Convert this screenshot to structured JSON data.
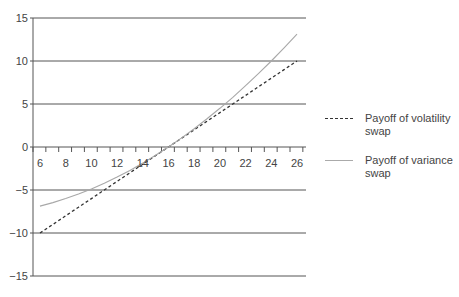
{
  "chart_data": {
    "type": "line",
    "title": "",
    "xlabel": "",
    "ylabel": "",
    "x": [
      6,
      7,
      8,
      9,
      10,
      11,
      12,
      13,
      14,
      15,
      16,
      17,
      18,
      19,
      20,
      21,
      22,
      23,
      24,
      25,
      26
    ],
    "x_tick_labels": [
      "6",
      "8",
      "10",
      "12",
      "14",
      "16",
      "18",
      "20",
      "22",
      "24",
      "26"
    ],
    "y_tick_labels": [
      "15",
      "10",
      "5",
      "0",
      "-5",
      "-10",
      "-15"
    ],
    "ylim": [
      -15,
      15
    ],
    "xlim": [
      6,
      26
    ],
    "grid": "horizontal",
    "legend_position": "right",
    "series": [
      {
        "name": "Payoff of volatility swap",
        "style": "dashed",
        "color": "#333333",
        "values": [
          -10,
          -9,
          -8,
          -7,
          -6,
          -5,
          -4,
          -3,
          -2,
          -1,
          0,
          1,
          2,
          3,
          4,
          5,
          6,
          7,
          8,
          9,
          10
        ]
      },
      {
        "name": "Payoff of variance swap",
        "style": "solid",
        "color": "#a8a8a8",
        "values": [
          -6.875,
          -6.469,
          -6.0,
          -5.469,
          -4.875,
          -4.219,
          -3.5,
          -2.719,
          -1.875,
          -0.969,
          0,
          1.031,
          2.125,
          3.281,
          4.5,
          5.781,
          7.125,
          8.531,
          10.0,
          11.531,
          13.125
        ]
      }
    ]
  },
  "legend": {
    "items": [
      {
        "line1": "Payoff of volatility",
        "line2": "swap"
      },
      {
        "line1": "Payoff of variance",
        "line2": "swap"
      }
    ]
  }
}
